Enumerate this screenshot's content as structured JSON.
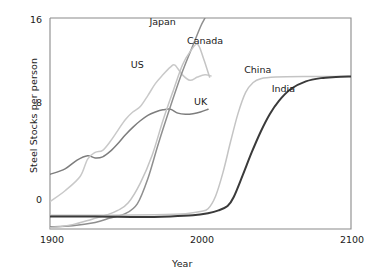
{
  "chart_data": {
    "type": "line",
    "title": "",
    "xlabel": "Year",
    "ylabel": "Steel Stocks per person",
    "xlim": [
      1900,
      2100
    ],
    "ylim": [
      -2.6,
      16.7
    ],
    "xticks": [
      1900,
      2000,
      2100
    ],
    "xticklabels": [
      "1900",
      "2000",
      "2100"
    ],
    "yticks": [
      0,
      8,
      16
    ],
    "yticklabels": [
      "0",
      "8",
      "16"
    ],
    "grid": false,
    "legend_position": "inline-annotations",
    "series": [
      {
        "name": "UK",
        "color": "#7d7d7d",
        "label_x": 2000,
        "label_y": 9.0,
        "x": [
          1900,
          1910,
          1918,
          1925,
          1930,
          1935,
          1940,
          1945,
          1950,
          1955,
          1960,
          1965,
          1970,
          1975,
          1980,
          1985,
          1990,
          1995,
          2000,
          2005
        ],
        "y": [
          2.4,
          2.9,
          3.7,
          4.1,
          3.9,
          4.0,
          4.5,
          5.2,
          6.0,
          6.7,
          7.3,
          7.8,
          8.1,
          8.3,
          8.35,
          8.0,
          7.9,
          7.95,
          8.1,
          8.35
        ]
      },
      {
        "name": "US",
        "color": "#c9c9c9",
        "label_x": 1958,
        "label_y": 12.4,
        "x": [
          1900,
          1910,
          1920,
          1925,
          1930,
          1935,
          1940,
          1945,
          1950,
          1955,
          1960,
          1965,
          1970,
          1975,
          1980,
          1983,
          1988,
          1993,
          1998,
          2003,
          2007
        ],
        "y": [
          -0.1,
          0.9,
          2.2,
          3.8,
          4.4,
          4.6,
          5.4,
          6.4,
          7.4,
          8.1,
          8.6,
          9.6,
          10.7,
          11.5,
          12.2,
          12.4,
          11.5,
          11.0,
          11.3,
          11.5,
          11.4
        ]
      },
      {
        "name": "Japan",
        "color": "#8f8f8f",
        "label_x": 1975,
        "label_y": 16.3,
        "x": [
          1900,
          1915,
          1930,
          1940,
          1950,
          1958,
          1965,
          1972,
          1980,
          1988,
          1995,
          2000,
          2003
        ],
        "y": [
          -2.4,
          -2.3,
          -2.0,
          -1.6,
          -1.2,
          -0.3,
          2.0,
          5.2,
          8.6,
          11.8,
          14.2,
          15.9,
          16.7
        ]
      },
      {
        "name": "Canada",
        "color": "#c4c4c4",
        "label_x": 2003,
        "label_y": 14.6,
        "x": [
          1900,
          1915,
          1928,
          1938,
          1945,
          1952,
          1960,
          1968,
          1975,
          1982,
          1988,
          1993,
          1998,
          2002,
          2006
        ],
        "y": [
          -2.5,
          -2.2,
          -1.7,
          -1.3,
          -0.9,
          -0.2,
          1.6,
          4.2,
          7.3,
          10.1,
          12.4,
          13.6,
          14.3,
          13.0,
          11.3
        ]
      },
      {
        "name": "China",
        "color": "#c4c4c4",
        "label_x": 2038,
        "label_y": 11.9,
        "x": [
          1900,
          1940,
          1970,
          1990,
          2000,
          2005,
          2010,
          2015,
          2020,
          2025,
          2030,
          2035,
          2040,
          2050,
          2070,
          2090,
          2100
        ],
        "y": [
          -1.35,
          -1.35,
          -1.3,
          -1.2,
          -1.0,
          -0.75,
          0.4,
          2.6,
          5.4,
          8.0,
          9.9,
          10.8,
          11.15,
          11.3,
          11.35,
          11.35,
          11.35
        ]
      },
      {
        "name": "India",
        "color": "#3a3a3a",
        "label_x": 2055,
        "label_y": 10.2,
        "x": [
          1900,
          1930,
          1960,
          1980,
          1995,
          2005,
          2012,
          2018,
          2022,
          2028,
          2034,
          2040,
          2046,
          2052,
          2060,
          2070,
          2080,
          2090,
          2100
        ],
        "y": [
          -1.45,
          -1.45,
          -1.5,
          -1.45,
          -1.35,
          -1.15,
          -0.9,
          -0.5,
          0.3,
          2.3,
          4.4,
          6.3,
          7.9,
          9.1,
          10.2,
          10.9,
          11.2,
          11.3,
          11.35
        ]
      }
    ]
  },
  "axes": {
    "ylabel": "Steel Stocks per person",
    "xlabel": "Year",
    "ytick_0": "0",
    "ytick_8": "8",
    "ytick_16": "16",
    "xtick_1900": "1900",
    "xtick_2000": "2000",
    "xtick_2100": "2100"
  },
  "labels": {
    "japan": "Japan",
    "canada": "Canada",
    "us": "US",
    "uk": "UK",
    "china": "China",
    "india": "India"
  },
  "colors": {
    "axis": "#8a8a8a",
    "text": "#1a1a1a",
    "uk": "#7d7d7d",
    "us": "#c9c9c9",
    "japan": "#8f8f8f",
    "canada": "#c4c4c4",
    "china": "#c4c4c4",
    "india": "#3a3a3a"
  }
}
